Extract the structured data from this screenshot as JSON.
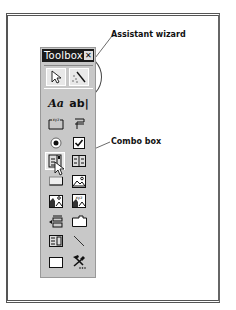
{
  "callouts": {
    "assistant_wizard": "Assistant wizard",
    "combo_box": "Combo box"
  },
  "toolbox": {
    "title": "Toolbox",
    "close_glyph": "✕",
    "top_tools": [
      {
        "name": "select-objects",
        "icon": "pointer-arrow-icon"
      },
      {
        "name": "control-wizards",
        "icon": "magic-wand-icon"
      }
    ],
    "tools": [
      {
        "name": "label",
        "icon": "label-aa-icon",
        "text": "Aa"
      },
      {
        "name": "text-box",
        "icon": "text-box-ab-icon",
        "text": "ab|"
      },
      {
        "name": "option-group",
        "icon": "option-group-icon",
        "text": "xyz"
      },
      {
        "name": "toggle-button",
        "icon": "toggle-button-icon"
      },
      {
        "name": "option-button",
        "icon": "radio-button-icon"
      },
      {
        "name": "check-box",
        "icon": "checkbox-icon"
      },
      {
        "name": "combo-box",
        "icon": "combo-box-icon"
      },
      {
        "name": "list-box",
        "icon": "list-box-icon"
      },
      {
        "name": "command-button",
        "icon": "command-button-icon"
      },
      {
        "name": "image",
        "icon": "image-icon"
      },
      {
        "name": "unbound-object-frame",
        "icon": "unbound-object-icon"
      },
      {
        "name": "bound-object-frame",
        "icon": "bound-object-icon",
        "text": "xyz"
      },
      {
        "name": "page-break",
        "icon": "page-break-icon"
      },
      {
        "name": "tab-control",
        "icon": "tab-control-icon"
      },
      {
        "name": "subform",
        "icon": "subform-icon"
      },
      {
        "name": "line",
        "icon": "line-icon"
      },
      {
        "name": "rectangle",
        "icon": "rectangle-icon"
      },
      {
        "name": "more-controls",
        "icon": "more-controls-hammer-icon"
      }
    ]
  }
}
